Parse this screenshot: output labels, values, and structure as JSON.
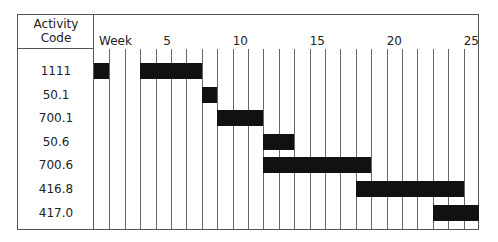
{
  "header": {
    "code_line1": "Activity",
    "code_line2": "Code",
    "week_label": "Week",
    "ticks": [
      {
        "week": 5,
        "label": "5"
      },
      {
        "week": 10,
        "label": "10"
      },
      {
        "week": 15,
        "label": "15"
      },
      {
        "week": 20,
        "label": "20"
      },
      {
        "week": 25,
        "label": "25"
      }
    ]
  },
  "total_weeks": 25,
  "bar_color": "#111111",
  "activities": [
    {
      "code": "1111",
      "bars": [
        {
          "start": 1,
          "end": 1
        },
        {
          "start": 4,
          "end": 7
        }
      ]
    },
    {
      "code": "50.1",
      "bars": [
        {
          "start": 8,
          "end": 8
        }
      ]
    },
    {
      "code": "700.1",
      "bars": [
        {
          "start": 9,
          "end": 11
        }
      ]
    },
    {
      "code": "50.6",
      "bars": [
        {
          "start": 12,
          "end": 13
        }
      ]
    },
    {
      "code": "700.6",
      "bars": [
        {
          "start": 12,
          "end": 18
        }
      ]
    },
    {
      "code": "416.8",
      "bars": [
        {
          "start": 18,
          "end": 24
        }
      ]
    },
    {
      "code": "417.0",
      "bars": [
        {
          "start": 23,
          "end": 25
        }
      ]
    }
  ]
}
